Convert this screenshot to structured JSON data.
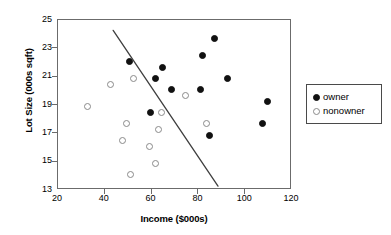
{
  "chart_data": {
    "type": "scatter",
    "title": "",
    "xlabel": "Income ($000s)",
    "ylabel": "Lot Size (000s sqft)",
    "xlim": [
      20,
      120
    ],
    "ylim": [
      13,
      25
    ],
    "xticks": [
      20,
      40,
      60,
      80,
      100,
      120
    ],
    "yticks": [
      13,
      15,
      17,
      19,
      21,
      23,
      25
    ],
    "grid": false,
    "legend_position": "right-outside",
    "legend": [
      "owner",
      "nonowner"
    ],
    "series": [
      {
        "name": "owner",
        "marker": "filled-circle",
        "color": "#111111",
        "points": [
          {
            "x": 51.0,
            "y": 22.0
          },
          {
            "x": 60.0,
            "y": 18.4
          },
          {
            "x": 62.0,
            "y": 20.8
          },
          {
            "x": 65.0,
            "y": 21.6
          },
          {
            "x": 69.0,
            "y": 20.0
          },
          {
            "x": 81.5,
            "y": 20.0
          },
          {
            "x": 82.0,
            "y": 22.4
          },
          {
            "x": 85.0,
            "y": 16.8
          },
          {
            "x": 87.5,
            "y": 23.6
          },
          {
            "x": 93.0,
            "y": 20.8
          },
          {
            "x": 108.0,
            "y": 17.6
          },
          {
            "x": 110.0,
            "y": 19.2
          }
        ]
      },
      {
        "name": "nonowner",
        "marker": "open-circle",
        "color": "#8a8a8a",
        "points": [
          {
            "x": 33.0,
            "y": 18.8
          },
          {
            "x": 43.0,
            "y": 20.4
          },
          {
            "x": 48.0,
            "y": 16.4
          },
          {
            "x": 49.5,
            "y": 17.6
          },
          {
            "x": 51.5,
            "y": 14.0
          },
          {
            "x": 52.5,
            "y": 20.8
          },
          {
            "x": 59.5,
            "y": 16.0
          },
          {
            "x": 62.0,
            "y": 14.8
          },
          {
            "x": 63.5,
            "y": 17.2
          },
          {
            "x": 64.5,
            "y": 18.4
          },
          {
            "x": 75.0,
            "y": 19.6
          },
          {
            "x": 84.0,
            "y": 17.6
          }
        ]
      }
    ],
    "annotations": [
      {
        "name": "discriminant-line",
        "type": "line",
        "from": {
          "x": 44.0,
          "y": 24.2
        },
        "to": {
          "x": 88.8,
          "y": 13.2
        },
        "color": "#3f3f3f"
      }
    ]
  }
}
